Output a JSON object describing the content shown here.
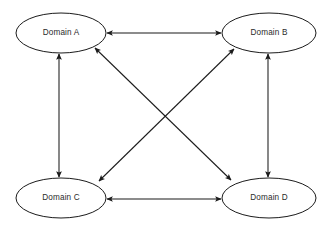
{
  "diagram": {
    "background_color": "#ffffff",
    "node_fill": "#ffffff",
    "node_stroke": "#1b1b1b",
    "edge_color": "#1b1b1b",
    "label_color": "#2b2b2b",
    "nodes": [
      {
        "id": "A",
        "label": "Domain A",
        "cx": 61,
        "cy": 33,
        "rx": 45,
        "ry": 20
      },
      {
        "id": "B",
        "label": "Domain B",
        "cx": 269,
        "cy": 33,
        "rx": 47,
        "ry": 20
      },
      {
        "id": "C",
        "label": "Domain C",
        "cx": 61,
        "cy": 198,
        "rx": 45,
        "ry": 20
      },
      {
        "id": "D",
        "label": "Domain D",
        "cx": 269,
        "cy": 198,
        "rx": 47,
        "ry": 20
      }
    ],
    "edges": [
      {
        "id": "a-b",
        "from": "A",
        "to": "B",
        "direction": "bidirectional",
        "x1": 107,
        "y1": 33,
        "x2": 221,
        "y2": 33
      },
      {
        "id": "c-d",
        "from": "C",
        "to": "D",
        "direction": "bidirectional",
        "x1": 107,
        "y1": 199,
        "x2": 221,
        "y2": 199
      },
      {
        "id": "a-c",
        "from": "A",
        "to": "C",
        "direction": "bidirectional",
        "x1": 59,
        "y1": 54,
        "x2": 59,
        "y2": 177
      },
      {
        "id": "b-d",
        "from": "B",
        "to": "D",
        "direction": "bidirectional",
        "x1": 268,
        "y1": 54,
        "x2": 268,
        "y2": 177
      },
      {
        "id": "a-d",
        "from": "A",
        "to": "D",
        "direction": "bidirectional",
        "x1": 95,
        "y1": 48,
        "x2": 231,
        "y2": 180
      },
      {
        "id": "b-c",
        "from": "B",
        "to": "C",
        "direction": "bidirectional",
        "x1": 234,
        "y1": 49,
        "x2": 99,
        "y2": 181
      }
    ]
  }
}
